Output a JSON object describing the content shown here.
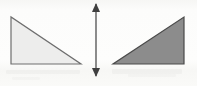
{
  "figure": {
    "canvas": {
      "width": 197,
      "height": 86
    },
    "background_color": "#fbfbfa"
  },
  "shapes": {
    "left_triangle": {
      "label": "light gray right triangle",
      "fill_color": "#ededec",
      "stroke_color": "#6e6e6e",
      "stroke_width": 1.2,
      "right_angle_at": "bottom-left",
      "points": "11,17 11,64 81,64",
      "vertices": [
        {
          "name": "top-left apex",
          "x": 11,
          "y": 17
        },
        {
          "name": "bottom-left right angle",
          "x": 11,
          "y": 64
        },
        {
          "name": "bottom-right",
          "x": 81,
          "y": 64
        }
      ],
      "width": 70,
      "height": 47
    },
    "right_triangle": {
      "label": "dark gray right triangle",
      "fill_color": "#8c8c8c",
      "stroke_color": "#4a4a4a",
      "stroke_width": 1.2,
      "right_angle_at": "bottom-right",
      "points": "184,17 184,64 113,64",
      "vertices": [
        {
          "name": "top-right apex",
          "x": 184,
          "y": 17
        },
        {
          "name": "bottom-right right angle",
          "x": 184,
          "y": 64
        },
        {
          "name": "bottom-left",
          "x": 113,
          "y": 64
        }
      ],
      "width": 71,
      "height": 47
    },
    "reflection_axis": {
      "label": "vertical double-headed arrow",
      "stroke_color": "#4f4f4f",
      "stroke_width": 1.3,
      "x": 96,
      "y_top": 4,
      "y_bottom": 76,
      "arrowhead_half_width": 4,
      "arrowhead_length": 9
    }
  }
}
